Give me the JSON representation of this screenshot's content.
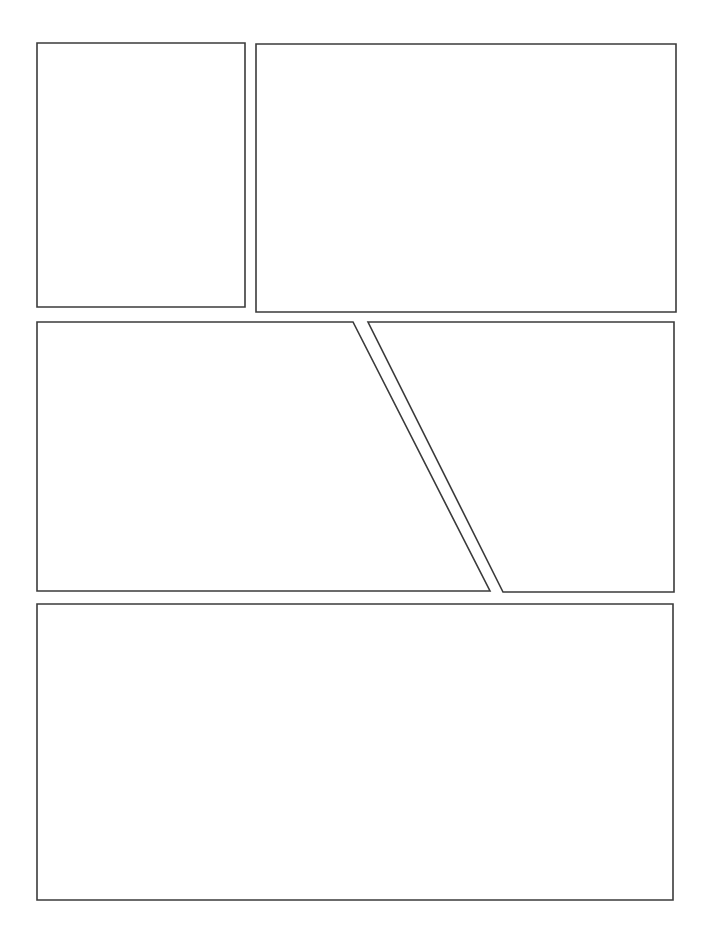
{
  "document": {
    "title": "Blank Comic Page Template",
    "page_label": "",
    "width": 706,
    "height": 941,
    "background_color": "#ffffff",
    "border_color": "#3b3b3b",
    "border_width_px": 1.6,
    "panel_fill": "#ffffff",
    "visible_text": []
  },
  "layout": {
    "rows": [
      {
        "name": "row-1",
        "panel_count": 2,
        "y_top": 43,
        "y_bottom": 312
      },
      {
        "name": "row-2",
        "panel_count": 2,
        "y_top": 322,
        "y_bottom": 593,
        "split": "diagonal"
      },
      {
        "name": "row-3",
        "panel_count": 1,
        "y_top": 604,
        "y_bottom": 900
      }
    ],
    "gutter_horizontal_px": 10,
    "gutter_vertical_px": 11,
    "margin_left_px": 37,
    "margin_right_px": 30,
    "margin_top_px": 43,
    "margin_bottom_px": 41
  },
  "panels": [
    {
      "id": "panel-1",
      "row": 1,
      "index": 1,
      "shape": "rectangle",
      "points": "37,43 245,43 245,307 37,307",
      "caption": "",
      "content": ""
    },
    {
      "id": "panel-2",
      "row": 1,
      "index": 2,
      "shape": "rectangle",
      "points": "256,44 676,44 676,312 256,312",
      "caption": "",
      "content": ""
    },
    {
      "id": "panel-3",
      "row": 2,
      "index": 1,
      "shape": "quadrilateral-diagonal-right",
      "points": "37,322 353,322 490,591 37,591",
      "caption": "",
      "content": ""
    },
    {
      "id": "panel-4",
      "row": 2,
      "index": 2,
      "shape": "quadrilateral-diagonal-left",
      "points": "368,322 674,322 674,592 503,592",
      "caption": "",
      "content": ""
    },
    {
      "id": "panel-5",
      "row": 3,
      "index": 1,
      "shape": "rectangle",
      "points": "37,604 673,604 673,900 37,900",
      "caption": "",
      "content": ""
    }
  ]
}
